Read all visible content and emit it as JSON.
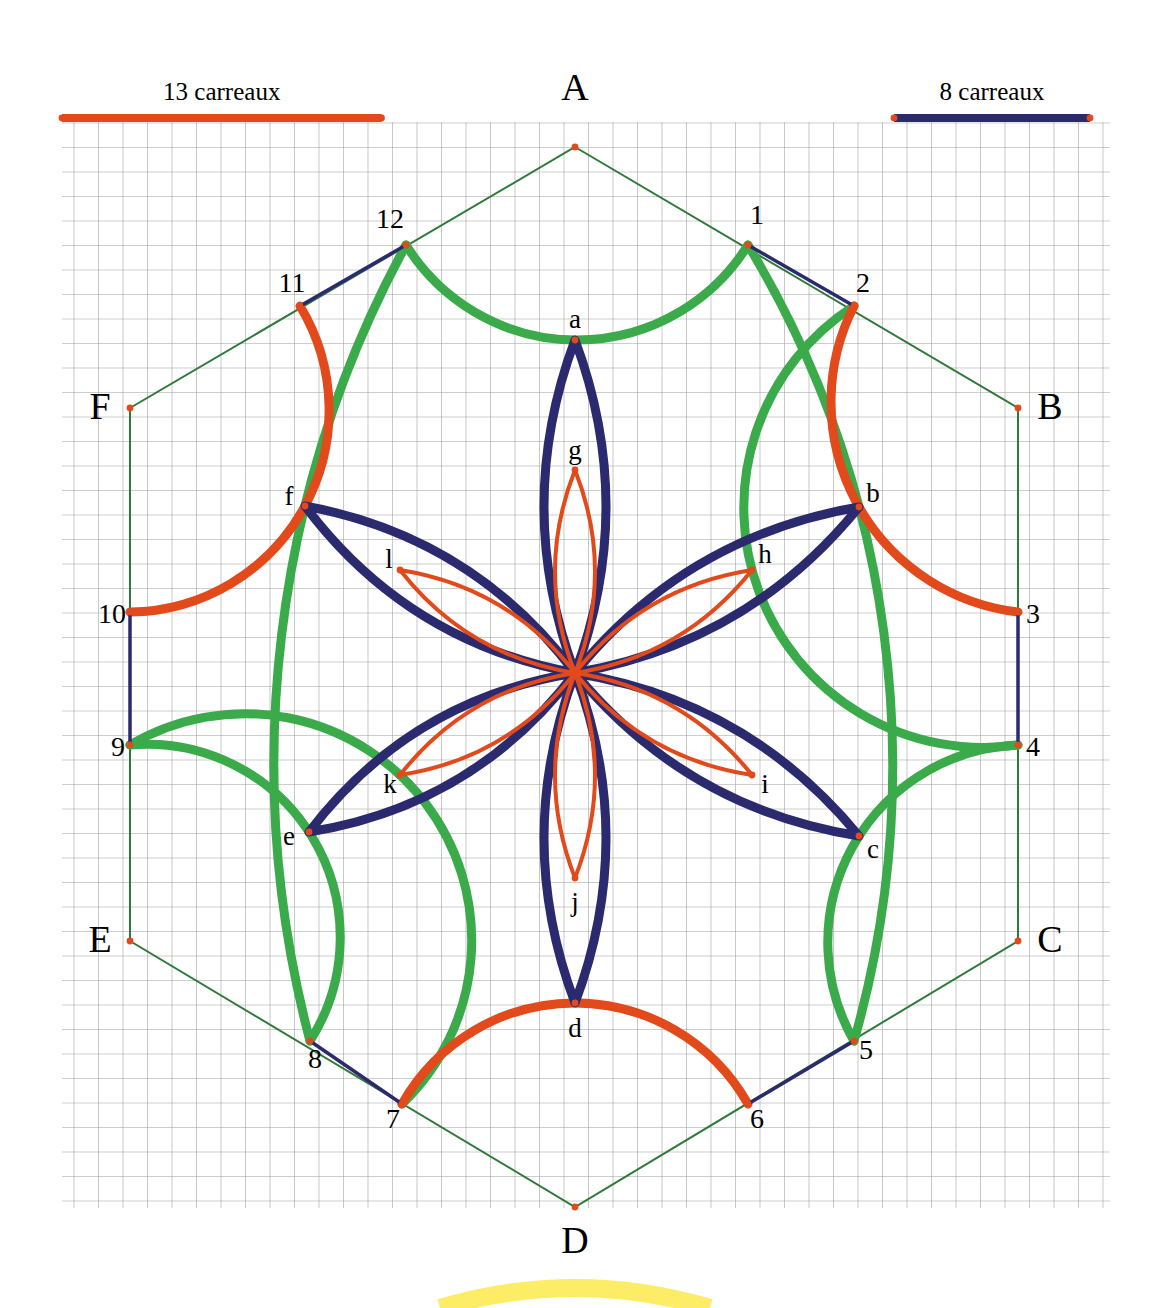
{
  "figure": {
    "title_hidden": "",
    "background": "#ffffff",
    "grid": {
      "cell_px": 24.5,
      "line_color": "#9a9a9a",
      "x0": 62,
      "y0": 122,
      "x1": 1110,
      "y1": 1208,
      "cols": 43,
      "rows": 44
    }
  },
  "legend": {
    "left": {
      "label": "13 carreaux",
      "color": "#e24a1b",
      "squares": 13,
      "x_start": 62,
      "x_end": 381.5,
      "y": 118
    },
    "right": {
      "label": "8 carreaux",
      "color": "#2b2a6e",
      "squares": 8,
      "x_start": 894,
      "x_end": 1090,
      "y": 118
    }
  },
  "colors": {
    "red": "#e24a1b",
    "navy": "#2b2a6e",
    "green": "#3aaa4a",
    "hex_outline": "#2f7a3a",
    "vertex_dot": "#e24a1b",
    "grid": "#9a9a9a",
    "yellow_arc": "#fbe94b"
  },
  "geometry": {
    "center": {
      "x": 575,
      "y": 673
    },
    "hex_radius": 392,
    "hex_flat_half_width": 444,
    "outer_rosette_radius": 200,
    "inner_rosette_radius": 118
  },
  "vertices": [
    {
      "id": "A",
      "label": "A",
      "x": 575,
      "y": 147,
      "label_x": 575,
      "label_y": 100
    },
    {
      "id": "B",
      "label": "B",
      "x": 1018,
      "y": 408,
      "label_x": 1050,
      "label_y": 419
    },
    {
      "id": "C",
      "label": "C",
      "x": 1018,
      "y": 941,
      "label_x": 1050,
      "label_y": 952
    },
    {
      "id": "D",
      "label": "D",
      "x": 575,
      "y": 1207,
      "label_x": 575,
      "label_y": 1253
    },
    {
      "id": "E",
      "label": "E",
      "x": 130,
      "y": 941,
      "label_x": 100,
      "label_y": 952
    },
    {
      "id": "F",
      "label": "F",
      "x": 130,
      "y": 408,
      "label_x": 100,
      "label_y": 419
    }
  ],
  "numbered_points": [
    {
      "id": "1",
      "label": "1",
      "x": 748,
      "y": 245,
      "label_x": 757,
      "label_y": 224
    },
    {
      "id": "2",
      "label": "2",
      "x": 854,
      "y": 306,
      "label_x": 863,
      "label_y": 292
    },
    {
      "id": "3",
      "label": "3",
      "x": 1018,
      "y": 612,
      "label_x": 1033,
      "label_y": 623
    },
    {
      "id": "4",
      "label": "4",
      "x": 1018,
      "y": 745,
      "label_x": 1033,
      "label_y": 756
    },
    {
      "id": "5",
      "label": "5",
      "x": 854,
      "y": 1041,
      "label_x": 866,
      "label_y": 1059
    },
    {
      "id": "6",
      "label": "6",
      "x": 748,
      "y": 1104,
      "label_x": 757,
      "label_y": 1128
    },
    {
      "id": "7",
      "label": "7",
      "x": 402,
      "y": 1104,
      "label_x": 393,
      "label_y": 1128
    },
    {
      "id": "8",
      "label": "8",
      "x": 310,
      "y": 1041,
      "label_x": 315,
      "label_y": 1068
    },
    {
      "id": "9",
      "label": "9",
      "x": 130,
      "y": 745,
      "label_x": 118,
      "label_y": 756
    },
    {
      "id": "10",
      "label": "10",
      "x": 130,
      "y": 612,
      "label_x": 112,
      "label_y": 623
    },
    {
      "id": "11",
      "label": "11",
      "x": 300,
      "y": 306,
      "label_x": 292,
      "label_y": 292
    },
    {
      "id": "12",
      "label": "12",
      "x": 406,
      "y": 245,
      "label_x": 390,
      "label_y": 228
    }
  ],
  "lettered_points": [
    {
      "id": "a",
      "label": "a",
      "x": 575,
      "y": 340,
      "label_x": 575,
      "label_y": 328
    },
    {
      "id": "b",
      "label": "b",
      "x": 859,
      "y": 507,
      "label_x": 873,
      "label_y": 502
    },
    {
      "id": "c",
      "label": "c",
      "x": 859,
      "y": 836,
      "label_x": 873,
      "label_y": 858
    },
    {
      "id": "d",
      "label": "d",
      "x": 575,
      "y": 1003,
      "label_x": 575,
      "label_y": 1037
    },
    {
      "id": "e",
      "label": "e",
      "x": 309,
      "y": 832,
      "label_x": 289,
      "label_y": 845
    },
    {
      "id": "f",
      "label": "f",
      "x": 305,
      "y": 506,
      "label_x": 289,
      "label_y": 505
    },
    {
      "id": "g",
      "label": "g",
      "x": 575,
      "y": 470,
      "label_x": 575,
      "label_y": 459
    },
    {
      "id": "h",
      "label": "h",
      "x": 752,
      "y": 570,
      "label_x": 765,
      "label_y": 563
    },
    {
      "id": "i",
      "label": "i",
      "x": 752,
      "y": 775,
      "label_x": 765,
      "label_y": 793
    },
    {
      "id": "j",
      "label": "j",
      "x": 575,
      "y": 878,
      "label_x": 575,
      "label_y": 911
    },
    {
      "id": "k",
      "label": "k",
      "x": 400,
      "y": 775,
      "label_x": 390,
      "label_y": 793
    },
    {
      "id": "l",
      "label": "l",
      "x": 400,
      "y": 570,
      "label_x": 389,
      "label_y": 568
    }
  ],
  "arcs": {
    "red_outer": [
      {
        "from": "11",
        "through": "f",
        "to": "10"
      },
      {
        "from": "2",
        "through": "b",
        "to": "3"
      },
      {
        "from": "7",
        "through": "d",
        "to": "6"
      }
    ],
    "green_outer": [
      {
        "from": "12",
        "through": "a",
        "to": "1"
      },
      {
        "from": "9",
        "through": "e",
        "to": "8"
      },
      {
        "from": "4",
        "through": "c",
        "to": "5"
      },
      {
        "from": "12",
        "through": "f",
        "to": "8"
      },
      {
        "from": "1",
        "through": "b",
        "to": "5"
      },
      {
        "from": "9",
        "through": "k",
        "to": "d_side"
      }
    ],
    "navy_segments": [
      {
        "from": "11",
        "to": "12"
      },
      {
        "from": "1",
        "to": "2"
      },
      {
        "from": "3",
        "to": "4"
      },
      {
        "from": "5",
        "to": "6"
      },
      {
        "from": "7",
        "to": "8"
      },
      {
        "from": "9",
        "to": "10"
      }
    ],
    "navy_petals": {
      "count": 6,
      "tips": [
        "a",
        "b",
        "c",
        "d",
        "e",
        "f"
      ],
      "stroke_width": 9
    },
    "red_petals": {
      "count": 6,
      "tips": [
        "g",
        "h",
        "i",
        "j",
        "k",
        "l"
      ],
      "stroke_width": 4
    }
  }
}
